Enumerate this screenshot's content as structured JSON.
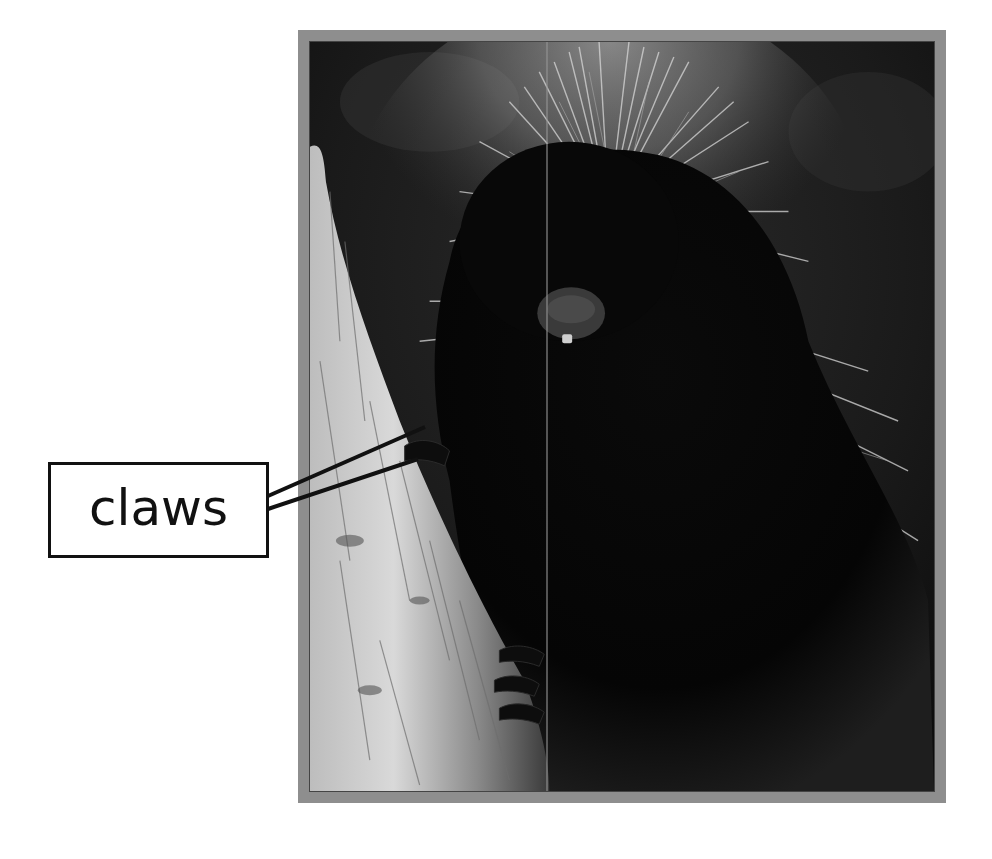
{
  "figure": {
    "photo_style": "black-and-white photograph",
    "frame_color": "#8e8e8e"
  },
  "callout": {
    "label": "claws",
    "target": "porcupine front claws gripping tree bark",
    "leader_lines": 2
  }
}
